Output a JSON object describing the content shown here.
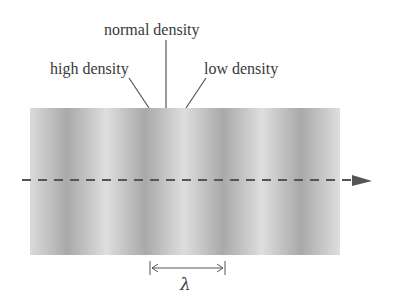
{
  "diagram": {
    "type": "longitudinal-wave-density",
    "labels": {
      "normal": "normal density",
      "high": "high density",
      "low": "low density",
      "wavelength": "λ"
    },
    "band": {
      "left": 30,
      "top": 108,
      "width": 310,
      "height": 147,
      "light_color": "#dedede",
      "dark_color": "#a9a9a9",
      "period_px": 78
    },
    "propagation_arrow": {
      "style": "dashed",
      "x1": 22,
      "y": 180,
      "x2": 372,
      "color": "#555555"
    },
    "wavelength_marker": {
      "x1": 150,
      "x2": 225,
      "y": 268
    },
    "colors": {
      "text": "#3a3a3a",
      "lines": "#555555"
    }
  }
}
